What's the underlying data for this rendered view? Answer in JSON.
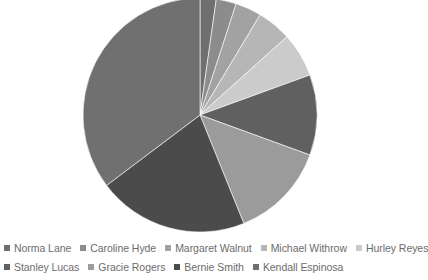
{
  "title": "",
  "legend": {
    "position": "bottom",
    "rows": [
      [
        "Norma Lane",
        "Caroline Hyde",
        "Margaret Walnut",
        "Michael Withrow",
        "Hurley Reyes"
      ],
      [
        "Stanley Lucas",
        "Gracie Rogers",
        "Bernie Smith",
        "Kendall Espinosa"
      ]
    ]
  },
  "colors": {
    "background": "#ffffff",
    "legend_text": "#6c6c6c",
    "slice_norma_lane": "#6f6f6f",
    "slice_caroline_hyde": "#8c8c8c",
    "slice_margaret_walnut": "#a2a2a2",
    "slice_michael_withrow": "#b6b6b6",
    "slice_hurley_reyes": "#cbcbcb",
    "slice_stanley_lucas": "#606060",
    "slice_gracie_rogers": "#9b9b9b",
    "slice_bernie_smith": "#4b4b4b",
    "slice_kendall_espinosa": "#707070"
  },
  "chart_data": {
    "type": "pie",
    "title": "",
    "xlabel": "",
    "ylabel": "",
    "legend_position": "bottom",
    "start_angle_deg": 0,
    "direction": "clockwise",
    "center_px": [
      200,
      115
    ],
    "radius_px": 117,
    "categories": [
      "Norma Lane",
      "Caroline Hyde",
      "Margaret Walnut",
      "Michael Withrow",
      "Hurley Reyes",
      "Stanley Lucas",
      "Gracie Rogers",
      "Bernie Smith",
      "Kendall Espinosa"
    ],
    "values": [
      8,
      10,
      13,
      17,
      22,
      40,
      48,
      75,
      127
    ],
    "percent": [
      2.2,
      2.8,
      3.6,
      4.7,
      6.1,
      11.1,
      13.3,
      20.8,
      35.3
    ],
    "angles_deg": [
      8,
      10,
      13,
      17,
      22,
      40,
      48,
      75,
      127
    ],
    "colors": [
      "#6f6f6f",
      "#8c8c8c",
      "#a2a2a2",
      "#b6b6b6",
      "#cbcbcb",
      "#606060",
      "#9b9b9b",
      "#4b4b4b",
      "#707070"
    ]
  }
}
